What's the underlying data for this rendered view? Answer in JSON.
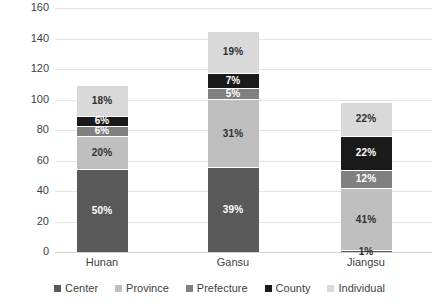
{
  "chart_data": {
    "type": "bar",
    "subtype": "stacked-bar-100-percent-labels",
    "title": "",
    "subtitle": "",
    "xlabel": "",
    "ylabel": "",
    "ylim": [
      0,
      160
    ],
    "ytick_step": 20,
    "yticks": [
      "160",
      "140",
      "120",
      "100",
      "80",
      "60",
      "40",
      "20",
      "0"
    ],
    "ytick_values": [
      160,
      140,
      120,
      100,
      80,
      60,
      40,
      20,
      0
    ],
    "grid": true,
    "legend_position": "bottom",
    "categories": [
      "Hunan",
      "Gansu",
      "Jiangsu"
    ],
    "totals": [
      109,
      143,
      100
    ],
    "series": [
      {
        "name": "Center",
        "color": "#595959",
        "values": [
          54.5,
          55.8,
          1.0
        ],
        "labels": [
          "50%",
          "39%",
          "1%"
        ],
        "percents": [
          50,
          39,
          1
        ],
        "label_color": [
          "on-dark",
          "on-dark",
          "on-light"
        ]
      },
      {
        "name": "Province",
        "color": "#bfbfbf",
        "values": [
          21.8,
          44.3,
          41.0
        ],
        "labels": [
          "20%",
          "31%",
          "41%"
        ],
        "percents": [
          20,
          31,
          41
        ],
        "label_color": [
          "on-light",
          "on-light",
          "on-light"
        ]
      },
      {
        "name": "Prefecture",
        "color": "#808080",
        "values": [
          6.5,
          7.2,
          12.0
        ],
        "labels": [
          "6%",
          "5%",
          "12%"
        ],
        "percents": [
          6,
          5,
          12
        ],
        "label_color": [
          "on-dark",
          "on-dark",
          "on-dark"
        ]
      },
      {
        "name": "County",
        "color": "#1a1a1a",
        "values": [
          6.5,
          10.0,
          22.0
        ],
        "labels": [
          "6%",
          "7%",
          "22%"
        ],
        "percents": [
          6,
          7,
          22
        ],
        "label_color": [
          "on-dark",
          "on-dark",
          "on-dark"
        ]
      },
      {
        "name": "Individual",
        "color": "#d9d9d9",
        "values": [
          19.6,
          27.2,
          22.0
        ],
        "labels": [
          "18%",
          "19%",
          "22%"
        ],
        "percents": [
          18,
          19,
          22
        ],
        "label_color": [
          "on-light",
          "on-light",
          "on-light"
        ]
      }
    ]
  },
  "legend": {
    "items": [
      {
        "label": "Center",
        "color": "#595959"
      },
      {
        "label": "Province",
        "color": "#bfbfbf"
      },
      {
        "label": "Prefecture",
        "color": "#808080"
      },
      {
        "label": "County",
        "color": "#1a1a1a"
      },
      {
        "label": "Individual",
        "color": "#d9d9d9"
      }
    ]
  }
}
